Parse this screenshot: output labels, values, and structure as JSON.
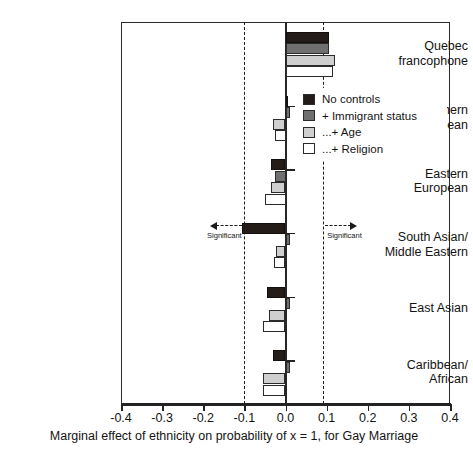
{
  "chart_data": {
    "type": "bar",
    "orientation": "horizontal",
    "title": "",
    "xlabel": "Marginal effect of ethnicity on probability of x = 1, for Gay Marriage",
    "ylabel": "",
    "xlim": [
      -0.4,
      0.4
    ],
    "xticks": [
      -0.4,
      -0.3,
      -0.2,
      -0.1,
      0.0,
      0.1,
      0.2,
      0.3,
      0.4
    ],
    "xticklabels": [
      "-0.4",
      "-0.3",
      "-0.2",
      "-0.1",
      "0.0",
      "0.1",
      "0.2",
      "0.3",
      "0.4"
    ],
    "grid": false,
    "legend_position": "upper right",
    "zero_line": 0.0,
    "significance_thresholds": [
      -0.1,
      0.09
    ],
    "categories": [
      "Quebec\nfrancophone",
      "Southern\nEuropean",
      "Eastern\nEuropean",
      "South Asian/\nMiddle Eastern",
      "East Asian",
      "Caribbean/\nAfrican"
    ],
    "series": [
      {
        "name": "No controls",
        "color": "#231c18",
        "values": [
          0.105,
          0.005,
          -0.035,
          -0.105,
          -0.045,
          -0.03
        ]
      },
      {
        "name": "+ Immigrant status",
        "color": "#6f6f6f",
        "values": [
          0.105,
          0.012,
          -0.025,
          0.012,
          0.012,
          0.012
        ]
      },
      {
        "name": "...+ Age",
        "color": "#cfcfcf",
        "values": [
          0.12,
          -0.03,
          -0.035,
          -0.022,
          -0.04,
          -0.055
        ]
      },
      {
        "name": "...+ Religion",
        "color": "#ffffff",
        "values": [
          0.115,
          -0.025,
          -0.05,
          -0.028,
          -0.055,
          -0.055
        ]
      }
    ]
  },
  "annotations": {
    "significant_left": "Significant",
    "significant_right": "Significant"
  },
  "legend": {
    "entries": [
      {
        "label": "No controls",
        "color": "#231c18"
      },
      {
        "label": "+ Immigrant status",
        "color": "#6f6f6f"
      },
      {
        "label": "...+ Age",
        "color": "#cfcfcf"
      },
      {
        "label": "...+ Religion",
        "color": "#ffffff"
      }
    ]
  },
  "colors": {
    "axis": "#232323",
    "text": "#131313",
    "background": "#ffffff"
  }
}
